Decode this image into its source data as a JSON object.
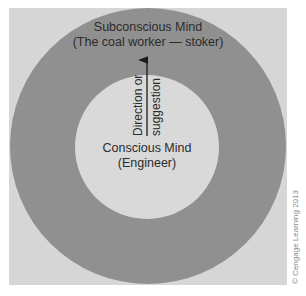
{
  "diagram": {
    "outer_circle": {
      "title": "Subconscious Mind",
      "subtitle": "(The coal worker — stoker)",
      "color": "#8f8f8f"
    },
    "inner_circle": {
      "title": "Conscious Mind",
      "subtitle": "(Engineer)",
      "color": "#d9d9d9"
    },
    "arrow": {
      "label_line1": "Direction or",
      "label_line2": "suggestion",
      "direction": "up"
    },
    "background_color": "#d6d6d6",
    "copyright": "© Cengage Learning 2013"
  }
}
